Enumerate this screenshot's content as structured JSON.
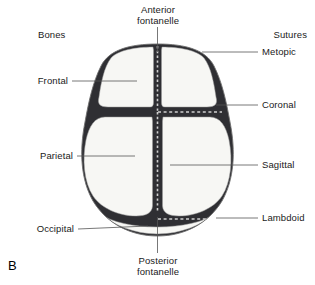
{
  "figure": {
    "letter": "B"
  },
  "headers": {
    "left": "Bones",
    "right": "Sutures"
  },
  "labels": {
    "anterior_fontanelle_line1": "Anterior",
    "anterior_fontanelle_line2": "fontanelle",
    "posterior_fontanelle_line1": "Posterior",
    "posterior_fontanelle_line2": "fontanelle",
    "frontal": "Frontal",
    "parietal": "Parietal",
    "occipital": "Occipital",
    "metopic": "Metopic",
    "coronal": "Coronal",
    "sagittal": "Sagittal",
    "lambdoid": "Lambdoid"
  },
  "colors": {
    "bone_fill": "#f7f7f4",
    "outline": "#6e6e6e",
    "suture_dark": "#2f2f33",
    "suture_dash": "#cfcfcf",
    "leader_line": "#555555",
    "text": "#1a1a1a",
    "background": "#ffffff"
  },
  "anatomy": {
    "bones": [
      {
        "name": "frontal-left",
        "label_key": "frontal"
      },
      {
        "name": "frontal-right",
        "label_key": "frontal"
      },
      {
        "name": "parietal-left",
        "label_key": "parietal"
      },
      {
        "name": "parietal-right",
        "label_key": "parietal"
      },
      {
        "name": "occipital",
        "label_key": "occipital"
      }
    ],
    "sutures": [
      {
        "name": "metopic",
        "orientation": "vertical-superior"
      },
      {
        "name": "coronal",
        "orientation": "horizontal-anterior"
      },
      {
        "name": "sagittal",
        "orientation": "vertical-midline"
      },
      {
        "name": "lambdoid",
        "orientation": "horizontal-posterior"
      }
    ],
    "fontanelles": [
      {
        "name": "anterior-fontanelle",
        "position": "superior-midline"
      },
      {
        "name": "posterior-fontanelle",
        "position": "inferior-midline"
      }
    ]
  }
}
